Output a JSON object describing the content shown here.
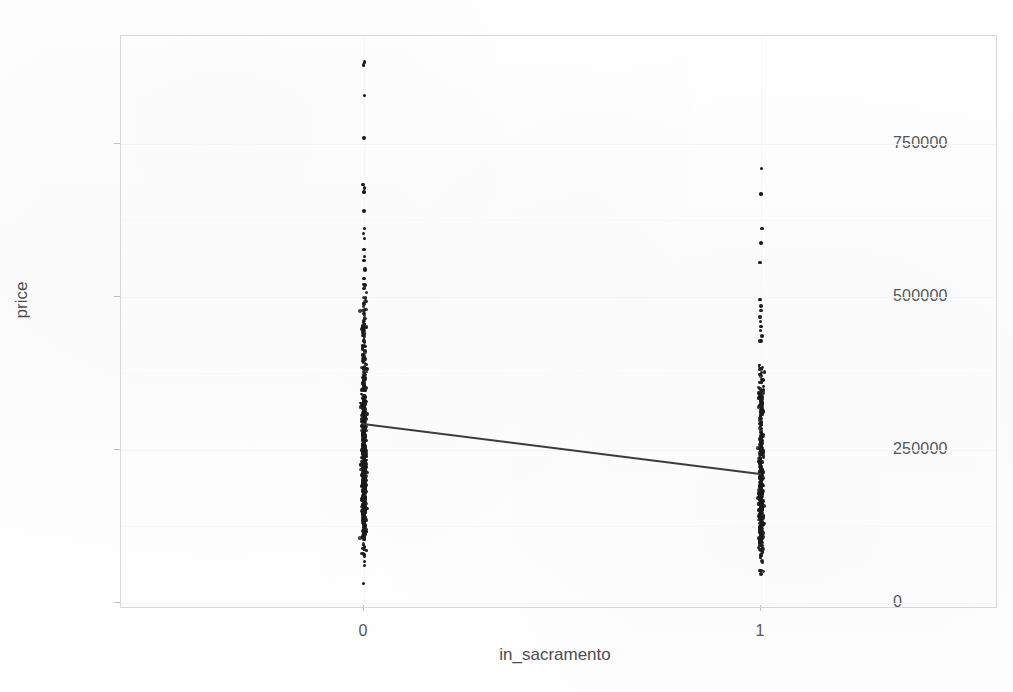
{
  "figure": {
    "background_color": "#fefefe",
    "frame_color": "#d9d9dc",
    "point_color": "#1a1a1a",
    "line_color": "#3c3c3c"
  },
  "axes": {
    "xlabel": "in_sacramento",
    "ylabel": "price",
    "x_ticks": [
      "0",
      "1"
    ],
    "y_ticks": [
      "0",
      "250000",
      "500000",
      "750000"
    ]
  },
  "chart_data": {
    "type": "scatter",
    "title": "",
    "xlabel": "in_sacramento",
    "ylabel": "price",
    "xlim": [
      -0.4,
      1.6
    ],
    "ylim": [
      0,
      940000
    ],
    "x_ticks": [
      0,
      1
    ],
    "x_tick_labels": [
      "0",
      "1"
    ],
    "y_ticks": [
      0,
      250000,
      500000,
      750000
    ],
    "y_tick_labels": [
      "0",
      "250000",
      "500000",
      "750000"
    ],
    "grid": true,
    "legend": "none",
    "series": [
      {
        "name": "price by in_sacramento",
        "kind": "scatter",
        "description": "Two vertical strips of price observations, one at in_sacramento=0 and one at in_sacramento=1",
        "groups": [
          {
            "x": 0,
            "n_points": 640,
            "min": 32000,
            "max": 884000,
            "dense_range": [
              100000,
              520000
            ],
            "median": 242000,
            "outliers": [
              884000,
              879000,
              830000,
              760000,
              684000,
              678000,
              672000,
              640000,
              612000,
              604000,
              596000,
              578000,
              566000,
              560000,
              545000,
              530000,
              520000,
              68000,
              62000,
              32000
            ]
          },
          {
            "x": 1,
            "n_points": 440,
            "min": 47000,
            "max": 710000,
            "dense_range": [
              80000,
              390000
            ],
            "median": 196000,
            "outliers": [
              710000,
              668000,
              612000,
              588000,
              556000,
              496000,
              486000,
              478000,
              468000,
              460000,
              452000,
              445000,
              436000,
              428000,
              53000,
              47000
            ]
          }
        ]
      },
      {
        "name": "fitted regression line",
        "kind": "line",
        "x": [
          0,
          1
        ],
        "y": [
          291000,
          209000
        ],
        "slope": -82000,
        "intercept": 291000
      }
    ]
  }
}
